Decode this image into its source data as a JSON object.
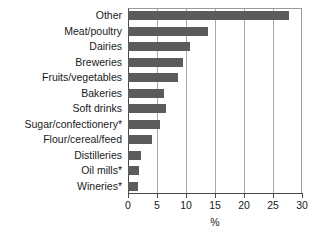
{
  "chart_data": {
    "type": "bar",
    "orientation": "horizontal",
    "title": "",
    "xlabel": "%",
    "ylabel": "",
    "xlim": [
      0,
      30
    ],
    "xticks": [
      0,
      5,
      10,
      15,
      20,
      25,
      30
    ],
    "xtick_labels": [
      "0",
      "5",
      "10",
      "15",
      "20",
      "25",
      "30"
    ],
    "grid": true,
    "grid_axis": "x",
    "legend": false,
    "bar_color": "#5b5b5b",
    "categories": [
      "Other",
      "Meat/poultry",
      "Dairies",
      "Breweries",
      "Fruits/vegetables",
      "Bakeries",
      "Soft drinks",
      "Sugar/confectionery*",
      "Flour/cereal/feed",
      "Distilleries",
      "Oil mills*",
      "Wineries*"
    ],
    "values": [
      27.7,
      13.8,
      10.7,
      9.5,
      8.6,
      6.2,
      6.5,
      5.5,
      4.2,
      2.2,
      1.9,
      1.7
    ]
  }
}
